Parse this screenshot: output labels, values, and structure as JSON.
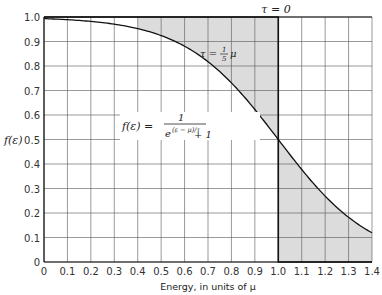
{
  "chart_data": {
    "type": "line",
    "title": "",
    "xlabel": "Energy, in units of μ",
    "ylabel": "f(ε)",
    "xlim": [
      0,
      1.4
    ],
    "ylim": [
      0,
      1.0
    ],
    "grid": true,
    "x_ticks": [
      "0",
      "0.1",
      "0.2",
      "0.3",
      "0.4",
      "0.5",
      "0.6",
      "0.7",
      "0.8",
      "0.9",
      "1.0",
      "1.1",
      "1.2",
      "1.3",
      "1.4"
    ],
    "y_ticks": [
      "0",
      "0.1",
      "0.2",
      "0.3",
      "0.4",
      "0.5",
      "0.6",
      "0.7",
      "0.8",
      "0.9",
      "1.0"
    ],
    "series": [
      {
        "name": "τ = 0",
        "x": [
          0,
          1.0,
          1.0,
          1.4
        ],
        "y": [
          1.0,
          1.0,
          0,
          0
        ]
      },
      {
        "name": "τ = (1/5)μ",
        "x": [
          0,
          0.1,
          0.2,
          0.3,
          0.4,
          0.5,
          0.6,
          0.7,
          0.8,
          0.9,
          1.0,
          1.1,
          1.2,
          1.3,
          1.4
        ],
        "y": [
          0.993,
          0.989,
          0.982,
          0.971,
          0.953,
          0.924,
          0.881,
          0.818,
          0.731,
          0.622,
          0.5,
          0.378,
          0.269,
          0.182,
          0.119
        ]
      }
    ],
    "shaded_regions": [
      "between curves for 0.5 < x < 1.0 (above curve)",
      "between curves for 1.0 < x < 1.4 (below curve)"
    ],
    "annotations": [
      {
        "text": "τ = 0",
        "x": 1.0,
        "y": 1.0
      },
      {
        "text": "τ = ⅕μ",
        "x": 0.82,
        "y": 0.88
      },
      {
        "text": "f(ε) = 1 / (e^((ε − μ)/τ) + 1)",
        "x": 0.6,
        "y": 0.5
      }
    ],
    "legend": "none"
  },
  "labels": {
    "ylabel": "f(ε)",
    "xlabel": "Energy, in units of μ",
    "tau0": "τ = 0",
    "tau_curve_prefix": "τ =",
    "tau_curve_num": "1",
    "tau_curve_den": "5",
    "tau_curve_suffix": "μ",
    "formula_lhs": "f(ε) =",
    "formula_num": "1",
    "formula_den_base": "e",
    "formula_den_exp": "(ε − μ)/τ",
    "formula_den_plus": "+ 1"
  }
}
